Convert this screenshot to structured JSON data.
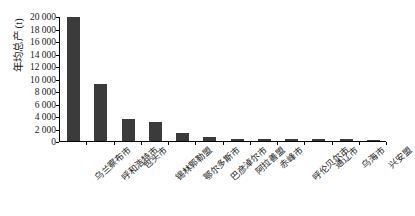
{
  "chart_data": {
    "type": "bar",
    "title": "",
    "xlabel": "",
    "ylabel": "年均总产（t）",
    "ylabel_plain": "年均总产 (t)",
    "ylim": [
      0,
      20000
    ],
    "ytick_step": 2000,
    "grid": false,
    "legend": null,
    "bar_color": "#3b3b3b",
    "axis_color": "#000000",
    "categories": [
      "乌兰察布市",
      "呼和浩特市",
      "包头市",
      "锡林郭勒盟",
      "鄂尔多斯市",
      "巴彦淖尔市",
      "阿拉善盟",
      "赤峰市",
      "呼伦贝尔市",
      "通辽市",
      "乌海市",
      "兴安盟"
    ],
    "values": [
      19950,
      9270,
      3580,
      3090,
      1350,
      700,
      400,
      330,
      300,
      280,
      250,
      230
    ],
    "ytick_labels": [
      "20 000",
      "18 000",
      "16 000",
      "14 000",
      "12 000",
      "10 000",
      "8 000",
      "6 000",
      "4 000",
      "2 000",
      "0"
    ],
    "ytick_values": [
      20000,
      18000,
      16000,
      14000,
      12000,
      10000,
      8000,
      6000,
      4000,
      2000,
      0
    ]
  }
}
